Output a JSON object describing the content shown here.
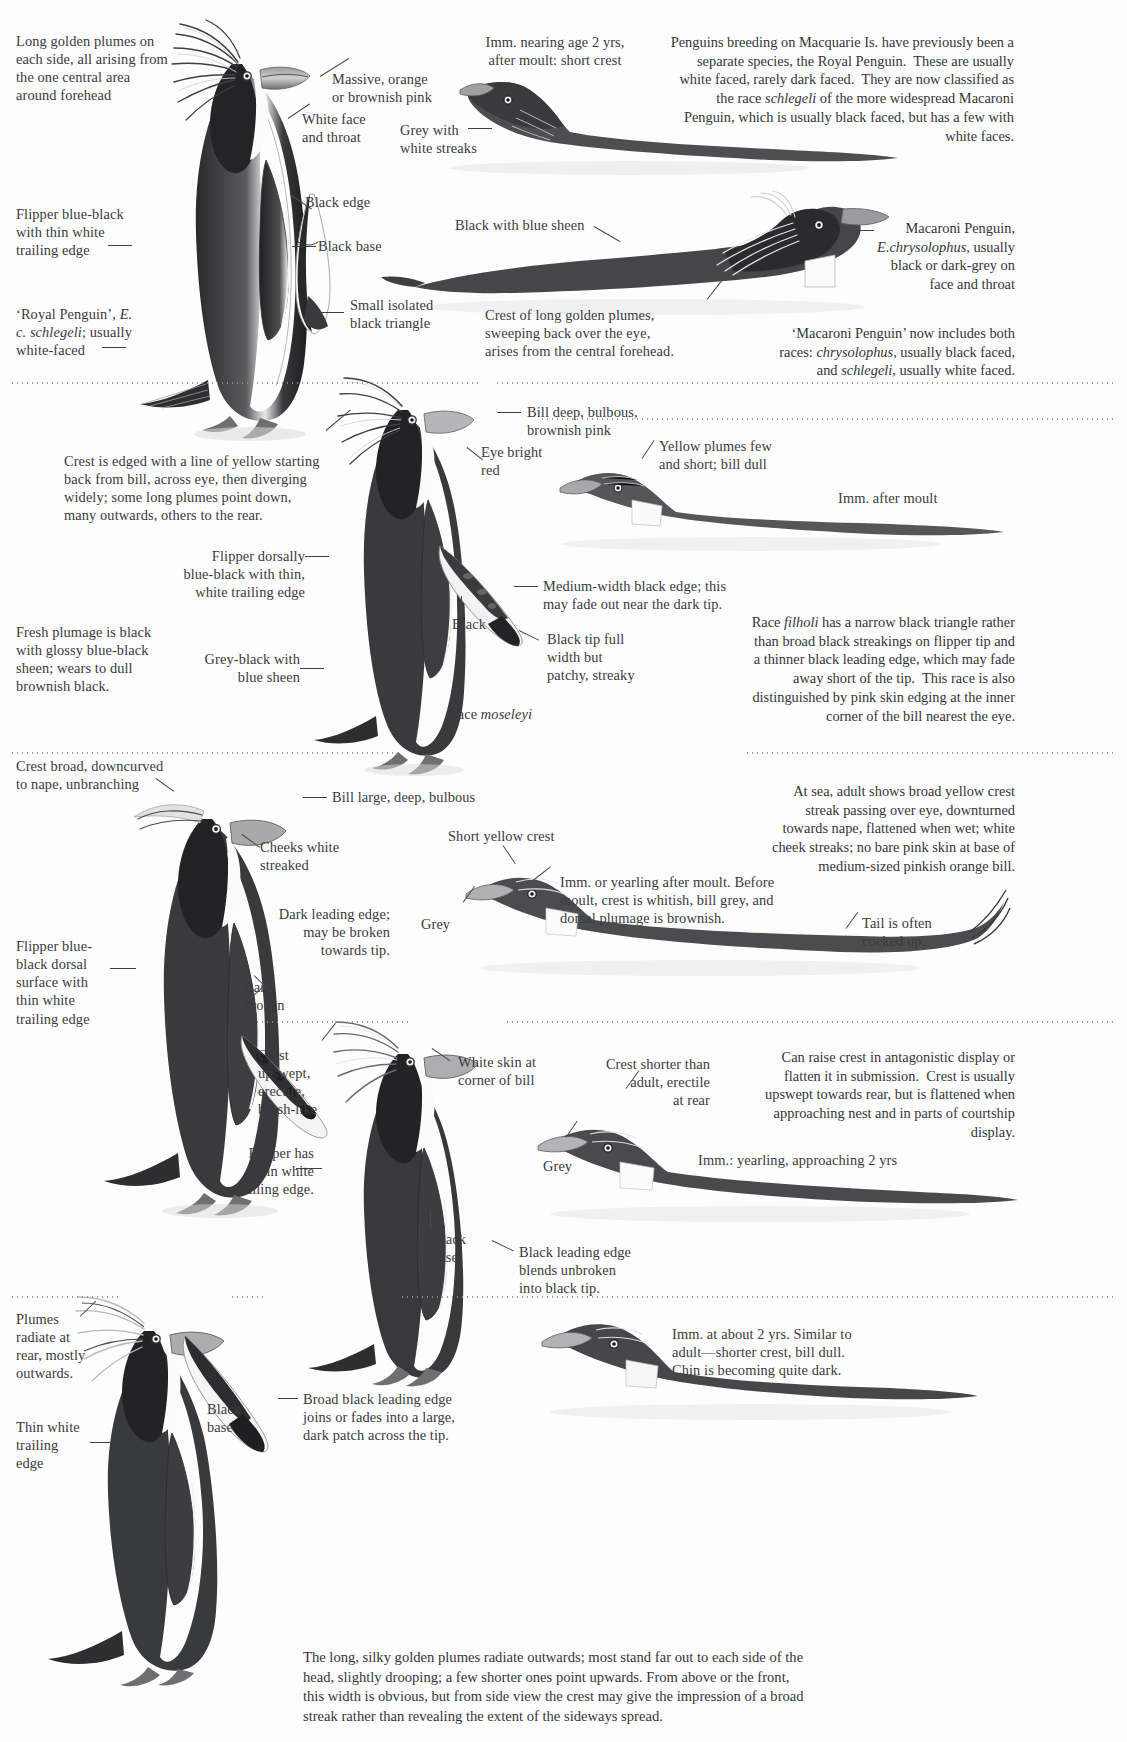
{
  "page": {
    "width": 1127,
    "height": 1742,
    "background": "#fdfdfd",
    "ink": "#2b2b2e",
    "text_color": "#3a3a3e",
    "divider_color": "#8e8e94"
  },
  "panels": [
    {
      "id": "royal-macaroni",
      "species_focus": "Royal Penguin / Macaroni Penguin",
      "labels": [
        {
          "name": "long-golden-plumes",
          "text": "Long golden plumes on\neach side, all arising from\nthe one central area\naround forehead",
          "align": "left"
        },
        {
          "name": "massive-orange-bill",
          "text": "Massive, orange\nor brownish pink",
          "align": "left"
        },
        {
          "name": "white-face-and-throat",
          "text": "White face\nand throat",
          "align": "left"
        },
        {
          "name": "grey-with-white-streaks",
          "text": "Grey with\nwhite streaks",
          "align": "left"
        },
        {
          "name": "imm-nearing-age-2",
          "text": "Imm. nearing age 2 yrs,\nafter moult: short crest",
          "align": "right"
        },
        {
          "name": "black-edge",
          "text": "Black edge",
          "align": "left"
        },
        {
          "name": "black-base",
          "text": "Black base",
          "align": "left"
        },
        {
          "name": "small-isolated-black-triangle",
          "text": "Small isolated\nblack triangle",
          "align": "left"
        },
        {
          "name": "flipper-blue-black",
          "text": "Flipper blue-black\nwith thin white\ntrailing edge",
          "align": "left"
        },
        {
          "name": "royal-penguin-id",
          "text": "‘Royal Penguin’, E.\nc. schlegeli; usually\nwhite-faced",
          "align": "left",
          "italic_parts": [
            "E.",
            "c. schlegeli"
          ]
        },
        {
          "name": "black-with-blue-sheen",
          "text": "Black with blue sheen",
          "align": "left"
        },
        {
          "name": "macaroni-penguin-id",
          "text": "Macaroni Penguin,\nE. chrysolophus, usually\nblack or dark-grey on\nface and throat",
          "align": "right",
          "italic_parts": [
            "E. chrysolophus"
          ]
        },
        {
          "name": "crest-of-long-golden-plumes",
          "text": "Crest of long golden plumes,\nsweeping back over the eye,\narises from the central forehead.",
          "align": "left"
        }
      ],
      "notes": [
        {
          "name": "macquarie-note",
          "align": "right",
          "text": "Penguins breeding on Macquarie Is. have previously been a separate species, the Royal Penguin. These are usually white faced, rarely dark faced. They are now classified as the race schlegeli of the more widespread Macaroni Penguin, which is usually black faced, but has a few with white faces.",
          "italic_parts": [
            "schlegeli"
          ]
        },
        {
          "name": "macaroni-includes-note",
          "align": "right",
          "text": "‘Macaroni Penguin’ now includes both races: chrysolophus, usually black faced, and schlegeli, usually white faced.",
          "italic_parts": [
            "chrysolophus",
            "schlegeli"
          ]
        }
      ]
    },
    {
      "id": "rockhopper-moseleyi",
      "species_focus": "Race moseleyi / Race filholi",
      "labels": [
        {
          "name": "crest-edged-yellow",
          "text": "Crest is edged with a line of yellow starting\nback from bill, across eye, then diverging\nwidely; some long plumes point down,\nmany outwards, others to the rear.",
          "align": "left"
        },
        {
          "name": "bill-deep-bulbous",
          "text": "Bill deep, bulbous,\nbrownish pink",
          "align": "left"
        },
        {
          "name": "eye-bright-red",
          "text": "Eye bright\nred",
          "align": "left"
        },
        {
          "name": "yellow-plumes-few",
          "text": "Yellow plumes few\nand short; bill dull",
          "align": "left"
        },
        {
          "name": "imm-after-moult",
          "text": "Imm. after moult",
          "align": "left"
        },
        {
          "name": "flipper-dorsally-blue-black",
          "text": "Flipper dorsally\nblue-black with thin,\nwhite trailing edge",
          "align": "left"
        },
        {
          "name": "medium-width-black-edge",
          "text": "Medium-width black edge; this\nmay fade out near the dark tip.",
          "align": "left"
        },
        {
          "name": "black-label",
          "text": "Black",
          "align": "left"
        },
        {
          "name": "black-tip-full-width",
          "text": "Black tip full\nwidth but\npatchy, streaky",
          "align": "left"
        },
        {
          "name": "fresh-plumage-black",
          "text": "Fresh plumage is black\nwith glossy blue-black\nsheen; wears to dull\nbrownish black.",
          "align": "left"
        },
        {
          "name": "grey-black-blue-sheen",
          "text": "Grey-black with\nblue sheen",
          "align": "left"
        },
        {
          "name": "race-moseleyi",
          "text": "Race moseleyi",
          "align": "left",
          "italic_parts": [
            "moseleyi"
          ]
        }
      ],
      "notes": [
        {
          "name": "race-filholi-note",
          "align": "right",
          "text": "Race filholi has a narrow black triangle rather than broad black streakings on flipper tip and a thinner black leading edge, which may fade away short of the tip. This race is also distinguished by pink skin edging at the inner corner of the bill nearest the eye.",
          "italic_parts": [
            "filholi"
          ]
        }
      ]
    },
    {
      "id": "rockhopper-adult",
      "species_focus": "Rockhopper adult / immature",
      "labels": [
        {
          "name": "crest-broad-downcurved",
          "text": "Crest broad, downcurved\nto nape, unbranching",
          "align": "left"
        },
        {
          "name": "bill-large-deep-bulbous",
          "text": "Bill large, deep, bulbous",
          "align": "left"
        },
        {
          "name": "cheeks-white-streaked",
          "text": "Cheeks white\nstreaked",
          "align": "left"
        },
        {
          "name": "short-yellow-crest",
          "text": "Short yellow crest",
          "align": "left"
        },
        {
          "name": "imm-or-yearling-after-moult",
          "text": "Imm. or yearling after moult. Before\nmoult, crest is whitish, bill grey, and\ndorsal plumage is brownish.",
          "align": "left"
        },
        {
          "name": "grey-label-1",
          "text": "Grey",
          "align": "left"
        },
        {
          "name": "dark-leading-edge",
          "text": "Dark leading edge;\nmay be broken\ntowards tip.",
          "align": "left"
        },
        {
          "name": "tail-cocked-up",
          "text": "Tail is often\ncocked up.",
          "align": "left"
        },
        {
          "name": "flipper-blue-black-dorsal",
          "text": "Flipper blue-\nblack dorsal\nsurface with\nthin white\ntrailing edge",
          "align": "left"
        },
        {
          "name": "bars-broken",
          "text": "Bars,\nbroken",
          "align": "left"
        }
      ],
      "notes": [
        {
          "name": "at-sea-note",
          "align": "right",
          "text": "At sea, adult shows broad yellow crest streak passing over eye, downturned towards nape, flattened when wet; white cheek streaks; no bare pink skin at base of medium-sized pinkish orange bill."
        }
      ]
    },
    {
      "id": "fiordland-erect",
      "species_focus": "Erect-crested / courtship display",
      "labels": [
        {
          "name": "crest-upswept-erectile",
          "text": "Crest\nupswept,\nerectile,\nbrush-like",
          "align": "left"
        },
        {
          "name": "white-skin-corner-of-bill",
          "text": "White skin at\ncorner of bill",
          "align": "left"
        },
        {
          "name": "crest-shorter-than-adult",
          "text": "Crest shorter than\nadult, erectile\nat rear",
          "align": "right"
        },
        {
          "name": "grey-label-2",
          "text": "Grey",
          "align": "left"
        },
        {
          "name": "imm-yearling-approaching-2",
          "text": "Imm.: yearling, approaching 2 yrs",
          "align": "left"
        },
        {
          "name": "flipper-has-thin-white",
          "text": "Flipper has\nthin white\ntrailing edge.",
          "align": "left"
        },
        {
          "name": "black-base-2",
          "text": "Black\nbase",
          "align": "left"
        },
        {
          "name": "black-leading-edge-blends",
          "text": "Black leading edge\nblends unbroken\ninto black tip.",
          "align": "left"
        }
      ],
      "notes": [
        {
          "name": "antagonistic-display-note",
          "align": "right",
          "text": "Can raise crest in antagonistic display or flatten it in submission. Crest is usually upswept towards rear, but is flattened when approaching nest and in parts of courtship display."
        }
      ]
    },
    {
      "id": "bottom-plumes",
      "species_focus": "Plumes radiating rear",
      "labels": [
        {
          "name": "plumes-radiate-at-rear",
          "text": "Plumes\nradiate at\nrear, mostly\noutwards.",
          "align": "left"
        },
        {
          "name": "thin-white-trailing-edge",
          "text": "Thin white\ntrailing\nedge",
          "align": "left"
        },
        {
          "name": "black-base-3",
          "text": "Black\nbase",
          "align": "left"
        },
        {
          "name": "broad-black-leading-edge",
          "text": "Broad black leading edge\njoins or fades into a large,\ndark patch across the tip.",
          "align": "left"
        },
        {
          "name": "imm-about-2-yrs",
          "text": "Imm. at about 2 yrs. Similar to\nadult—shorter crest, bill dull.\nChin is becoming quite dark.",
          "align": "left"
        }
      ],
      "notes": []
    }
  ],
  "footer": {
    "name": "bottom-caption",
    "text": "The long, silky golden plumes radiate outwards; most stand far out to each side of the head, slightly drooping; a few shorter ones point upwards. From above or the front, this width is obvious, but from side view the crest may give the impression of a broad streak rather than revealing the extent of the sideways spread."
  },
  "dividers": [
    {
      "name": "divider-1-left",
      "y": 382,
      "x": 10,
      "w": 470
    },
    {
      "name": "divider-1-right",
      "y": 382,
      "x": 495,
      "w": 620
    },
    {
      "name": "divider-2-right",
      "y": 418,
      "x": 540,
      "w": 575
    },
    {
      "name": "divider-3-left",
      "y": 752,
      "x": 10,
      "w": 385
    },
    {
      "name": "divider-3-right",
      "y": 752,
      "x": 745,
      "w": 370
    },
    {
      "name": "divider-4-left",
      "y": 1021,
      "x": 255,
      "w": 155
    },
    {
      "name": "divider-4-right",
      "y": 1021,
      "x": 505,
      "w": 610
    },
    {
      "name": "divider-5-left",
      "y": 1296,
      "x": 10,
      "w": 110
    },
    {
      "name": "divider-5-mid",
      "y": 1296,
      "x": 230,
      "w": 35
    },
    {
      "name": "divider-5-right",
      "y": 1296,
      "x": 400,
      "w": 715
    }
  ]
}
